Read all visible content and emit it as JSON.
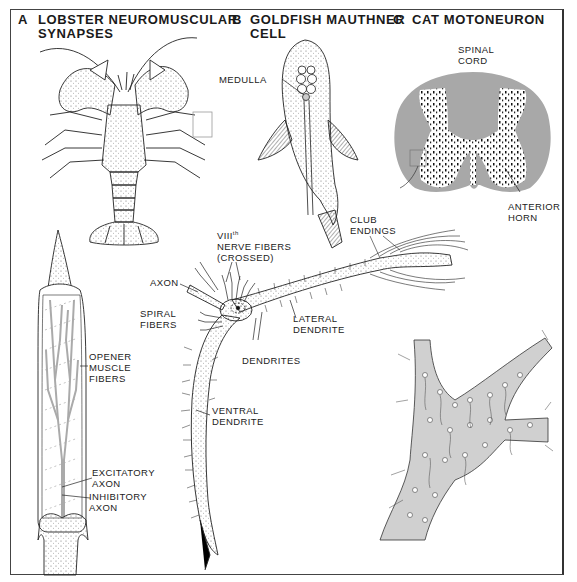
{
  "figure": {
    "panels": [
      {
        "letter": "A",
        "title_line1": "LOBSTER NEUROMUSCULAR",
        "title_line2": "SYNAPSES",
        "labels": {
          "opener1": "OPENER",
          "opener2": "MUSCLE",
          "opener3": "FIBERS",
          "excit1": "EXCITATORY",
          "excit2": "AXON",
          "inhib1": "INHIBITORY",
          "inhib2": "AXON"
        }
      },
      {
        "letter": "B",
        "title_line1": "GOLDFISH MAUTHNER",
        "title_line2": "CELL",
        "labels": {
          "medulla": "MEDULLA",
          "viii1": "VIII",
          "viii_sup": "th",
          "viii2": "NERVE FIBERS",
          "viii3": "(CROSSED)",
          "axon": "AXON",
          "spiral1": "SPIRAL",
          "spiral2": "FIBERS",
          "club1": "CLUB",
          "club2": "ENDINGS",
          "lateral1": "LATERAL",
          "lateral2": "DENDRITE",
          "dendrites": "DENDRITES",
          "ventral1": "VENTRAL",
          "ventral2": "DENDRITE"
        }
      },
      {
        "letter": "C",
        "title_line1": "CAT MOTONEURON",
        "title_line2": "",
        "labels": {
          "spinal1": "SPINAL",
          "spinal2": "CORD",
          "anterior1": "ANTERIOR",
          "anterior2": "HORN"
        }
      }
    ],
    "colors": {
      "line": "#222222",
      "gray_fill": "#a8a8a8",
      "light_gray": "#cfcfcf",
      "background": "#ffffff"
    }
  }
}
